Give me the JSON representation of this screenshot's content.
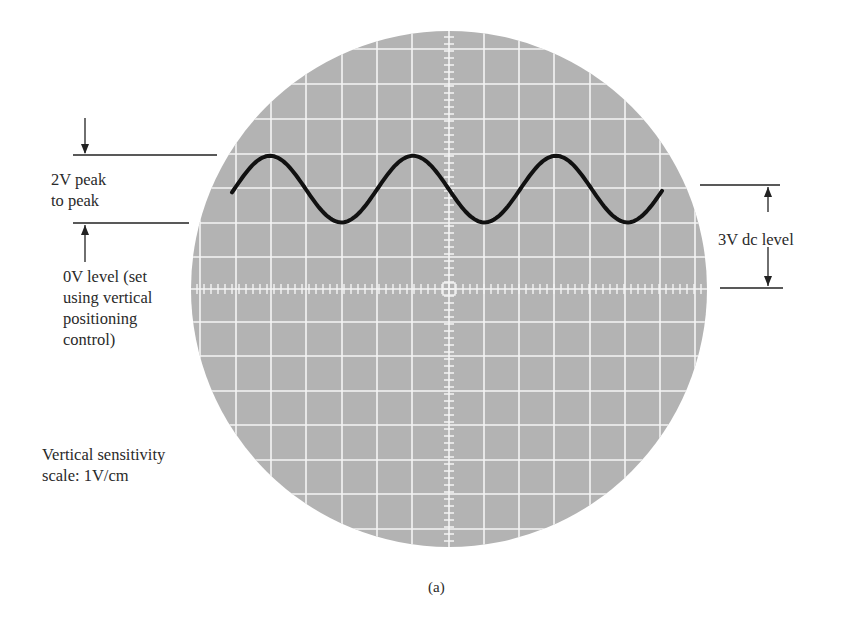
{
  "figure": {
    "caption": "(a)",
    "annotations": {
      "peak_to_peak": "2V peak\nto peak",
      "zero_level": "0V level (set\nusing vertical\npositioning\ncontrol)",
      "dc_level": "3V dc level",
      "sensitivity": "Vertical sensitivity\nscale: 1V/cm"
    },
    "colors": {
      "screen": "#b3b3b3",
      "grid": "#f4f4f4",
      "trace": "#111111",
      "lines": "#222222"
    }
  },
  "chart_data": {
    "type": "line",
    "caption": "(a)",
    "xlabel": "",
    "ylabel": "Volts (1V/cm vertical sensitivity)",
    "vertical_sensitivity": "1V/cm",
    "dc_level_V": 3,
    "peak_to_peak_V": 2,
    "zero_level_V": 0,
    "cycles_shown": 3,
    "grid": true,
    "series": [
      {
        "name": "trace",
        "x_cm": [
          -6.2,
          -5.1,
          -3.1,
          -1.1,
          0.9,
          2.9,
          4.9,
          6.1
        ],
        "y_V": [
          2.9,
          4.0,
          2.0,
          4.0,
          2.0,
          4.0,
          2.0,
          2.9
        ]
      }
    ]
  }
}
